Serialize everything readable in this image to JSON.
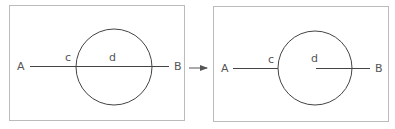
{
  "colors": {
    "stroke": "#444444",
    "frame": "#bbbbbb",
    "label": "#555555",
    "background": "#ffffff"
  },
  "left_panel": {
    "labels": {
      "A": "A",
      "B": "B",
      "c": "c",
      "d": "d"
    },
    "description": "Line AB passes fully through the circle"
  },
  "right_panel": {
    "labels": {
      "A": "A",
      "B": "B",
      "c": "c",
      "d": "d"
    },
    "description": "Segment from A stops at circle boundary c; second segment from center d to B"
  },
  "arrow": {
    "icon": "right-arrow-icon"
  }
}
